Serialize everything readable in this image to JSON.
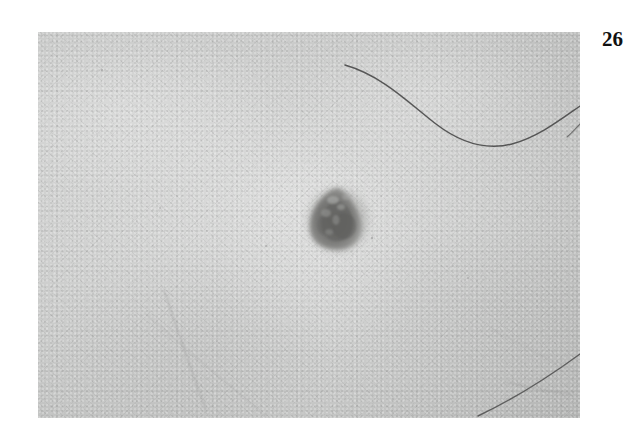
{
  "page": {
    "background_color": "#ffffff",
    "page_number": "26",
    "page_number_position": "top-right"
  },
  "figure": {
    "name": "clinical-skin-photograph",
    "caption": "",
    "frame": {
      "x": 38,
      "y": 32,
      "width": 542,
      "height": 386
    },
    "media_type": "grayscale-photograph",
    "colors": {
      "skin_light": "#c9cac9",
      "skin_mid": "#c3c4c3",
      "skin_dark_edge": "#b3b4b3",
      "lesion_core": "#6d6d6b",
      "lesion_mid": "#7e7e7c",
      "lesion_halo": "#9fa09e",
      "hair_dark": "#4a4a4a",
      "hair_faint": "#9a9a9a"
    },
    "lesion": {
      "name": "pigmented-lesion",
      "description": "dark roughly triangular pigmented nevus with irregular mottled surface",
      "center": {
        "x": 300,
        "y": 186
      },
      "size": {
        "width": 58,
        "height": 62
      },
      "shape": "irregular triangular / rounded-apex",
      "border": "slightly irregular, blurred margin"
    },
    "hairs": [
      {
        "name": "hair-strand-upper-right",
        "description": "long dark curved hair sweeping across the upper right of the field",
        "prominence": "dark",
        "path": "M 307,36 C 360,58 400,110 450,112 C 500,114 520,86 542,72"
      },
      {
        "name": "hair-strand-lower-right",
        "description": "dark thin hair curving along the lower right corner",
        "prominence": "dark",
        "path": "M 540,330 C 510,352 470,378 420,386"
      },
      {
        "name": "hair-strand-lower-left",
        "description": "faint thin hair running diagonally in the lower left quadrant",
        "prominence": "faint",
        "path": "M 128,262 C 140,300 152,340 166,372"
      },
      {
        "name": "hair-strand-lower-left-2",
        "description": "faint short hair crossing the lower left quadrant",
        "prominence": "faint",
        "path": "M 112,286 C 150,320 190,352 224,386"
      },
      {
        "name": "hair-strand-mid-right",
        "description": "very faint hair near the right margin mid-height",
        "prominence": "faint",
        "path": "M 470,300 C 500,316 522,332 542,344"
      }
    ],
    "speckles": {
      "name": "skin-grain-speckles",
      "description": "fine light stipple of pores and photographic grain across the skin"
    }
  }
}
